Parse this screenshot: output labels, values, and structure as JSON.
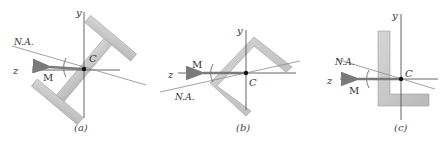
{
  "colors": {
    "section_fill": "#c8c8c8",
    "section_stroke": "#9a9a9a",
    "axis": "#555555",
    "neutral_axis": "#8a8a8a",
    "moment_arrow": "#7a7a7a",
    "centroid": "#111111"
  },
  "panels": [
    {
      "id": "a",
      "shape": "I-beam (rotated)",
      "axis_y": "y",
      "axis_z": "z",
      "centroid": "C",
      "neutral_axis": "N.A.",
      "moment": "M",
      "caption": "(a)"
    },
    {
      "id": "b",
      "shape": "angle section (rotated 45°)",
      "axis_y": "y",
      "axis_z": "z",
      "centroid": "C",
      "neutral_axis": "N.A.",
      "moment": "M",
      "caption": "(b)"
    },
    {
      "id": "c",
      "shape": "L-section",
      "axis_y": "y",
      "axis_z": "z",
      "centroid": "C",
      "neutral_axis": "N.A.",
      "moment": "M",
      "caption": "(c)"
    }
  ]
}
